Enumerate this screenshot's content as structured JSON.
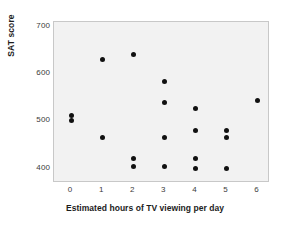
{
  "chart_data": {
    "type": "scatter",
    "title": "",
    "xlabel": "Estimated hours of TV viewing per day",
    "ylabel": "SAT score",
    "xlim": [
      -0.55,
      6.4
    ],
    "ylim": [
      370,
      710
    ],
    "xticks": [
      0,
      1,
      2,
      3,
      4,
      5,
      6
    ],
    "xticklabels": [
      "0",
      "1",
      "2",
      "3",
      "4",
      "5",
      "6"
    ],
    "yticks": [
      400,
      500,
      600,
      700
    ],
    "yticklabels": [
      "400",
      "500",
      "600",
      "700"
    ],
    "grid": false,
    "legend": null,
    "marker": "filled-circle",
    "marker_color": "#111111",
    "plot_background": "#f2f2f2",
    "frame_color": "#c8c8c8",
    "points": [
      {
        "x": 0,
        "y": 513
      },
      {
        "x": 0,
        "y": 502
      },
      {
        "x": 1,
        "y": 630
      },
      {
        "x": 1,
        "y": 466
      },
      {
        "x": 2,
        "y": 642
      },
      {
        "x": 2,
        "y": 422
      },
      {
        "x": 2,
        "y": 404
      },
      {
        "x": 3,
        "y": 585
      },
      {
        "x": 3,
        "y": 541
      },
      {
        "x": 3,
        "y": 466
      },
      {
        "x": 3,
        "y": 404
      },
      {
        "x": 4,
        "y": 528
      },
      {
        "x": 4,
        "y": 481
      },
      {
        "x": 4,
        "y": 421
      },
      {
        "x": 4,
        "y": 401
      },
      {
        "x": 5,
        "y": 481
      },
      {
        "x": 5,
        "y": 466
      },
      {
        "x": 5,
        "y": 401
      },
      {
        "x": 6,
        "y": 545
      }
    ]
  }
}
